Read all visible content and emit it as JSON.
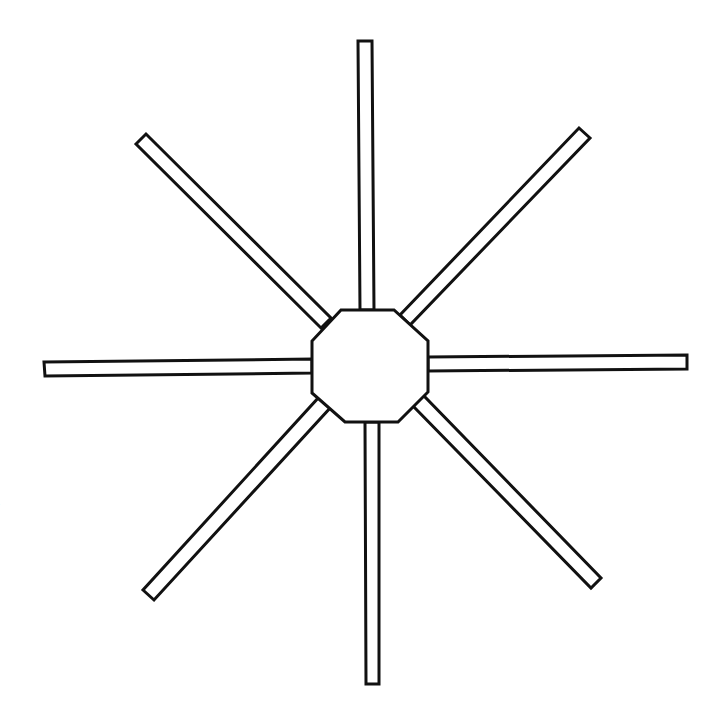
{
  "figure": {
    "stroke_color": "#111111",
    "fill_color": "#ffffff",
    "stroke_width": 3,
    "hub": {
      "shape": "octagon",
      "points": [
        [
          341,
          310
        ],
        [
          394,
          310
        ],
        [
          428,
          341
        ],
        [
          428,
          392
        ],
        [
          398,
          422
        ],
        [
          345,
          422
        ],
        [
          312,
          393
        ],
        [
          312,
          341
        ]
      ]
    },
    "spokes": [
      {
        "id": "north",
        "points": [
          [
            358,
            41
          ],
          [
            372,
            41
          ],
          [
            374,
            310
          ],
          [
            360,
            310
          ]
        ]
      },
      {
        "id": "south",
        "points": [
          [
            365,
            422
          ],
          [
            379,
            422
          ],
          [
            379,
            684
          ],
          [
            366,
            684
          ]
        ]
      },
      {
        "id": "west",
        "points": [
          [
            44,
            362
          ],
          [
            312,
            359
          ],
          [
            312,
            373
          ],
          [
            45,
            376
          ]
        ]
      },
      {
        "id": "east",
        "points": [
          [
            428,
            357
          ],
          [
            687,
            355
          ],
          [
            687,
            369
          ],
          [
            428,
            371
          ]
        ]
      },
      {
        "id": "northwest",
        "points": [
          [
            136,
            144
          ],
          [
            146,
            134
          ],
          [
            331,
            318
          ],
          [
            321,
            328
          ]
        ]
      },
      {
        "id": "northeast",
        "points": [
          [
            579,
            128
          ],
          [
            590,
            138
          ],
          [
            410,
            325
          ],
          [
            400,
            315
          ]
        ]
      },
      {
        "id": "southwest",
        "points": [
          [
            320,
            396
          ],
          [
            331,
            407
          ],
          [
            154,
            600
          ],
          [
            143,
            590
          ]
        ]
      },
      {
        "id": "southeast",
        "points": [
          [
            413,
            406
          ],
          [
            423,
            395
          ],
          [
            601,
            578
          ],
          [
            591,
            588
          ]
        ]
      }
    ]
  },
  "edge_text": {
    "left_fragment": "l"
  }
}
